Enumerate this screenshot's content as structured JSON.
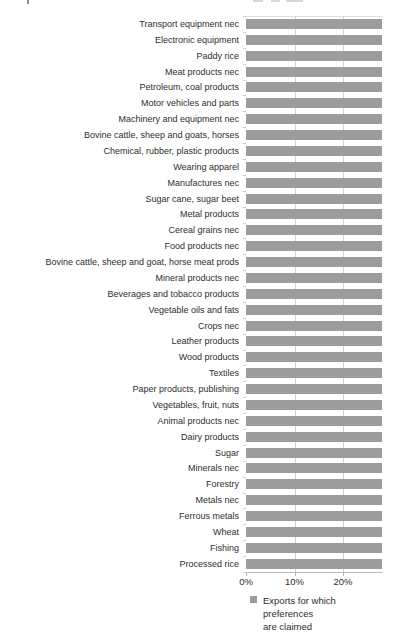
{
  "chart_data": {
    "type": "bar",
    "orientation": "horizontal",
    "title": "",
    "xlabel": "",
    "ylabel": "",
    "categories": [
      "Transport equipment nec",
      "Electronic equipment",
      "Paddy rice",
      "Meat products nec",
      "Petroleum, coal products",
      "Motor vehicles and parts",
      "Machinery and equipment nec",
      "Bovine cattle, sheep and goats, horses",
      "Chemical, rubber, plastic products",
      "Wearing apparel",
      "Manufactures nec",
      "Sugar cane, sugar beet",
      "Metal products",
      "Cereal grains nec",
      "Food products nec",
      "Bovine cattle, sheep and goat, horse meat prods",
      "Mineral products nec",
      "Beverages and tobacco products",
      "Vegetable oils and fats",
      "Crops nec",
      "Leather products",
      "Wood products",
      "Textiles",
      "Paper products, publishing",
      "Vegetables, fruit, nuts",
      "Animal products nec",
      "Dairy products",
      "Sugar",
      "Minerals nec",
      "Forestry",
      "Metals nec",
      "Ferrous metals",
      "Wheat",
      "Fishing",
      "Processed rice"
    ],
    "values": [
      28,
      28,
      28,
      28,
      28,
      28,
      28,
      28,
      28,
      28,
      28,
      28,
      28,
      28,
      28,
      28,
      28,
      28,
      28,
      28,
      28,
      28,
      28,
      28,
      28,
      28,
      28,
      28,
      28,
      28,
      28,
      28,
      28,
      28,
      28
    ],
    "unit": "%",
    "xticks": [
      0,
      10,
      20
    ],
    "xtick_labels": [
      "0%",
      "10%",
      "20%"
    ],
    "xlim_visible": [
      0,
      28
    ],
    "grid": "vertical gridlines at 10% and 20%",
    "legend_position": "bottom",
    "bar_color": "#9c9c9c",
    "gridline_color": "#d0d0d0",
    "note": "All 35 bars have equal visible length, reaching the right edge of the visible plot area (~28%); figure appears cropped on the right."
  },
  "legend": {
    "swatch_color": "#9c9c9c",
    "lines": [
      "Exports for which",
      "preferences",
      "are claimed"
    ]
  }
}
